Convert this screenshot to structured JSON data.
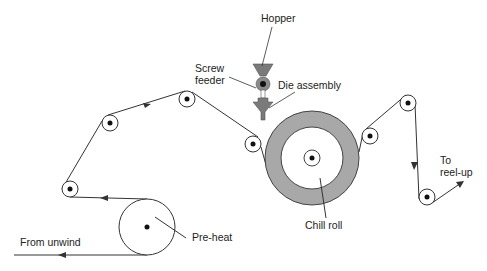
{
  "diagram": {
    "labels": {
      "hopper": "Hopper",
      "screw_feeder_1": "Screw",
      "screw_feeder_2": "feeder",
      "die_assembly": "Die assembly",
      "chill_roll": "Chill roll",
      "pre_heat": "Pre-heat",
      "from_unwind": "From unwind",
      "to_reelup_1": "To",
      "to_reelup_2": "reel-up"
    },
    "colors": {
      "line": "#333333",
      "chill_roll_fill": "#a8a8a8",
      "hopper_fill": "#7a7a7a",
      "feeder_fill": "#8a8a8a"
    },
    "rollers": [
      {
        "id": "roller-1",
        "cx": 70,
        "cy": 189
      },
      {
        "id": "roller-2",
        "cx": 110,
        "cy": 123
      },
      {
        "id": "roller-3",
        "cx": 187,
        "cy": 99
      },
      {
        "id": "roller-4",
        "cx": 253,
        "cy": 144
      },
      {
        "id": "roller-5",
        "cx": 370,
        "cy": 136
      },
      {
        "id": "roller-6",
        "cx": 408,
        "cy": 103
      },
      {
        "id": "roller-7",
        "cx": 427,
        "cy": 197
      }
    ],
    "pre_heat_roll": {
      "cx": 147,
      "cy": 227,
      "r": 28
    },
    "chill_roll": {
      "cx": 312,
      "cy": 158,
      "r_outer": 47,
      "r_inner": 31
    }
  }
}
